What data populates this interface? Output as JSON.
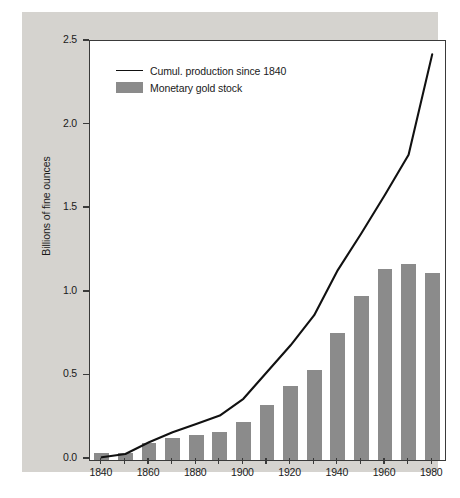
{
  "figure": {
    "background_color": "#d5d3cf",
    "plot_background_color": "#ffffff",
    "bar_color": "#8b8b8b",
    "line_color": "#111111"
  },
  "legend": {
    "position": "top-left-inside",
    "entries": [
      {
        "label": "Cumul. production since 1840",
        "marker": "line",
        "color": "#111111"
      },
      {
        "label": "Monetary gold stock",
        "marker": "box",
        "color": "#8b8b8b"
      }
    ]
  },
  "chart_data": {
    "type": "bar",
    "title": "",
    "xlabel": "",
    "ylabel": "Billions of fine ounces",
    "xlim": [
      1835,
      1985
    ],
    "ylim": [
      0.0,
      2.5
    ],
    "grid": false,
    "ytick_labels": [
      "0.0",
      "0.5",
      "1.0",
      "1.5",
      "2.0",
      "2.5"
    ],
    "ytick_values": [
      0.0,
      0.5,
      1.0,
      1.5,
      2.0,
      2.5
    ],
    "xtick_labels": [
      "1840",
      "1860",
      "1880",
      "1900",
      "1920",
      "1940",
      "1960",
      "1980"
    ],
    "xtick_values": [
      1840,
      1860,
      1880,
      1900,
      1920,
      1940,
      1960,
      1980
    ],
    "categories": [
      1840,
      1850,
      1860,
      1870,
      1880,
      1890,
      1900,
      1910,
      1920,
      1930,
      1940,
      1950,
      1960,
      1970,
      1980
    ],
    "series": [
      {
        "name": "Monetary gold stock",
        "type": "bar",
        "color": "#8b8b8b",
        "values": [
          0.04,
          0.04,
          0.1,
          0.13,
          0.15,
          0.17,
          0.23,
          0.33,
          0.44,
          0.54,
          0.76,
          0.98,
          1.14,
          1.17,
          1.12
        ]
      },
      {
        "name": "Cumul. production since 1840",
        "type": "line",
        "color": "#111111",
        "x": [
          1840,
          1850,
          1860,
          1870,
          1880,
          1890,
          1900,
          1910,
          1920,
          1930,
          1940,
          1950,
          1960,
          1970,
          1980
        ],
        "values": [
          0.01,
          0.03,
          0.1,
          0.16,
          0.21,
          0.26,
          0.36,
          0.52,
          0.68,
          0.86,
          1.13,
          1.35,
          1.58,
          1.82,
          2.42
        ]
      }
    ]
  }
}
